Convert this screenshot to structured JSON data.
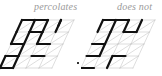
{
  "panels": [
    {
      "label": "percolates",
      "rows": 4,
      "cols": 4,
      "open_color": "#111111",
      "closed_color": "#c8c8c8",
      "open_edges": [
        [
          0,
          0,
          1,
          0
        ],
        [
          1,
          0,
          2,
          0
        ],
        [
          0,
          0,
          0,
          1
        ],
        [
          1,
          0,
          1,
          1
        ],
        [
          3,
          0,
          3,
          1
        ],
        [
          3,
          0,
          3,
          0.5
        ],
        [
          0,
          1,
          0,
          2
        ],
        [
          0,
          2,
          1,
          2
        ],
        [
          1,
          1,
          1,
          2
        ],
        [
          1,
          1,
          2,
          1
        ],
        [
          2,
          1,
          2,
          2
        ],
        [
          2,
          0,
          2,
          1
        ],
        [
          0,
          3,
          0,
          4
        ],
        [
          0,
          3,
          1,
          3
        ],
        [
          1,
          2,
          1,
          3
        ],
        [
          2,
          2,
          3,
          2
        ],
        [
          1,
          3,
          1,
          4
        ],
        [
          0,
          4,
          1,
          4
        ],
        [
          2,
          3,
          3,
          3
        ]
      ]
    },
    {
      "label": "does not",
      "rows": 4,
      "cols": 4,
      "open_color": "#111111",
      "closed_color": "#c8c8c8",
      "open_edges": [
        [
          0,
          0,
          1,
          0
        ],
        [
          1,
          0,
          2,
          0
        ],
        [
          0,
          0,
          0,
          1
        ],
        [
          1,
          0,
          1,
          1
        ],
        [
          3,
          0,
          3,
          1
        ],
        [
          2,
          0,
          2,
          1
        ],
        [
          2,
          1,
          3,
          1
        ],
        [
          0,
          2,
          1,
          2
        ],
        [
          1,
          1,
          1,
          2
        ],
        [
          0,
          3,
          1,
          3
        ],
        [
          1,
          2,
          1,
          3
        ],
        [
          0,
          4,
          1,
          4
        ],
        [
          2,
          3,
          3,
          3
        ],
        [
          2,
          3,
          2,
          4
        ]
      ]
    }
  ]
}
